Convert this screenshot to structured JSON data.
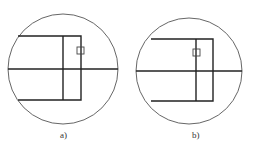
{
  "figure": {
    "panels": [
      {
        "label": "a)",
        "circle": {
          "cx": 63,
          "cy": 69,
          "r": 55
        },
        "rect": {
          "x1": 18,
          "y1": 36,
          "x2": 81,
          "y2": 100
        },
        "inner_vertical_x": 63,
        "center_horizontal_y": 69,
        "small_square": {
          "x": 77,
          "y": 47,
          "w": 7,
          "h": 7
        }
      },
      {
        "label": "b)",
        "circle": {
          "cx": 189,
          "cy": 71,
          "r": 53
        },
        "rect": {
          "x1": 151,
          "y1": 39,
          "x2": 213,
          "y2": 101
        },
        "inner_vertical_x": 196,
        "center_horizontal_y": 71,
        "small_square": {
          "x": 193,
          "y": 49,
          "w": 7,
          "h": 7
        }
      }
    ],
    "colors": {
      "line": "#222222",
      "circle": "#555555"
    }
  }
}
